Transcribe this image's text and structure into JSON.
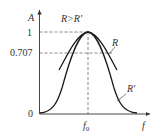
{
  "diagram": {
    "y_axis_label": "A",
    "x_axis_label": "f",
    "origin_label": "0",
    "center_frequency_label": "f0",
    "y_ticks": [
      {
        "label": "1",
        "value": 1.0
      },
      {
        "label": "0.707",
        "value": 0.707
      }
    ],
    "comparison_label": "R>R'",
    "curves": [
      {
        "name": "R",
        "label": "R",
        "description": "curve with higher R"
      },
      {
        "name": "R'",
        "label": "R'",
        "description": "curve with lower R'"
      }
    ],
    "colors": {
      "curve": "#1a1a1a",
      "axis": "#333333",
      "dashed": "#555555"
    }
  }
}
